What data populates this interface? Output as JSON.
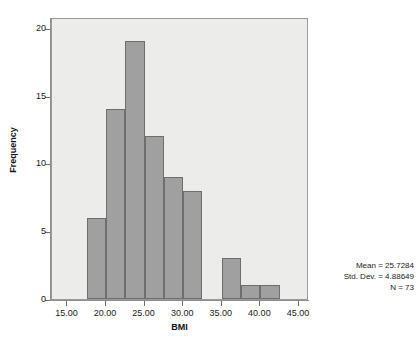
{
  "chart_data": {
    "type": "bar",
    "title": "",
    "subtitle": "",
    "xlabel": "BMI",
    "ylabel": "Frequency",
    "xlim": [
      13.0,
      46.3
    ],
    "ylim": [
      0,
      20.8
    ],
    "grid": false,
    "legend": null,
    "bin_width": 2.5,
    "xticks": [
      "15.00",
      "20.00",
      "25.00",
      "30.00",
      "35.00",
      "40.00",
      "45.00"
    ],
    "xtick_values": [
      15,
      20,
      25,
      30,
      35,
      40,
      45
    ],
    "yticks": [
      "0",
      "5",
      "10",
      "15",
      "20"
    ],
    "ytick_values": [
      0,
      5,
      10,
      15,
      20
    ],
    "bars": [
      {
        "bin_start": 17.5,
        "bin_end": 20.0,
        "value": 6
      },
      {
        "bin_start": 20.0,
        "bin_end": 22.5,
        "value": 14
      },
      {
        "bin_start": 22.5,
        "bin_end": 25.0,
        "value": 19
      },
      {
        "bin_start": 25.0,
        "bin_end": 27.5,
        "value": 12
      },
      {
        "bin_start": 27.5,
        "bin_end": 30.0,
        "value": 9
      },
      {
        "bin_start": 30.0,
        "bin_end": 32.5,
        "value": 8
      },
      {
        "bin_start": 35.0,
        "bin_end": 37.5,
        "value": 3
      },
      {
        "bin_start": 37.5,
        "bin_end": 40.0,
        "value": 1
      },
      {
        "bin_start": 40.0,
        "bin_end": 42.5,
        "value": 1
      }
    ],
    "categories": [
      "17.5-20",
      "20-22.5",
      "22.5-25",
      "25-27.5",
      "27.5-30",
      "30-32.5",
      "35-37.5",
      "37.5-40",
      "40-42.5"
    ],
    "values": [
      6,
      14,
      19,
      12,
      9,
      8,
      3,
      1,
      1
    ],
    "annotations": {
      "mean_label": "Mean = 25.7284",
      "std_dev_label": "Std. Dev. = 4.88649",
      "n_label": "N = 73"
    },
    "colors": {
      "bar_fill": "#a0a0a0",
      "bar_border": "#6e6e6e",
      "plot_background": "#ececeb",
      "axis": "#8d8d8d",
      "text": "#1a1a1a"
    }
  }
}
